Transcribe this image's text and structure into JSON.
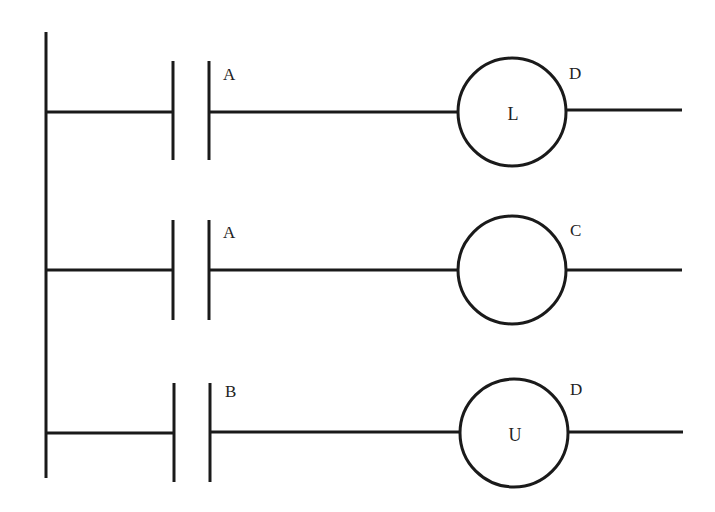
{
  "diagram": {
    "type": "ladder-logic",
    "colors": {
      "line": "#1a1a1a",
      "text": "#222222",
      "background": "#ffffff"
    },
    "rail": {
      "x": 46,
      "y1": 32,
      "y2": 478
    },
    "rungs": [
      {
        "y": 112,
        "contact": {
          "label": "A",
          "type": "normally-open",
          "x_left": 173,
          "x_right": 209,
          "y_top": 61,
          "y_bottom": 160
        },
        "coil": {
          "tag": "D",
          "inner_label": "L",
          "type": "latch",
          "cx": 512,
          "cy": 112,
          "r": 54
        },
        "output_end_x": 682
      },
      {
        "y": 270,
        "contact": {
          "label": "A",
          "type": "normally-open",
          "x_left": 173,
          "x_right": 209,
          "y_top": 220,
          "y_bottom": 320
        },
        "coil": {
          "tag": "C",
          "inner_label": "",
          "type": "output",
          "cx": 512,
          "cy": 270,
          "r": 54
        },
        "output_end_x": 682
      },
      {
        "y": 433,
        "contact": {
          "label": "B",
          "type": "normally-open",
          "x_left": 174,
          "x_right": 210,
          "y_top": 383,
          "y_bottom": 482
        },
        "coil": {
          "tag": "D",
          "inner_label": "U",
          "type": "unlatch",
          "cx": 514,
          "cy": 433,
          "r": 54
        },
        "output_end_x": 683
      }
    ]
  }
}
